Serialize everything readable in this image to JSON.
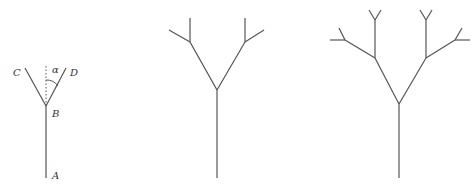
{
  "diagram": {
    "stroke_color": "#555555",
    "figures": [
      {
        "id": "stage-1",
        "labels": {
          "A": "A",
          "B": "B",
          "C": "C",
          "D": "D",
          "angle": "α"
        }
      },
      {
        "id": "stage-2"
      },
      {
        "id": "stage-3"
      }
    ]
  }
}
